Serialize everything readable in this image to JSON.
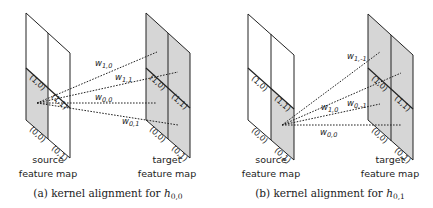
{
  "colors": {
    "stroke": "#222222",
    "shade": "#d6d6d6",
    "background": "#ffffff"
  },
  "panels": [
    {
      "id": "a",
      "caption": "(a) kernel alignment for ",
      "caption_math": "h",
      "caption_sub": "0,0",
      "source": {
        "label_line1": "source",
        "label_line2": "feature map",
        "cells": [
          "(1,0)",
          "(1,1)",
          "(0,0)",
          "(0,1)"
        ],
        "shaded_cells": [
          "(0,0)"
        ]
      },
      "target": {
        "label_line1": "target",
        "label_line2": "feature map",
        "cells": [
          "(1,0)",
          "(1,1)",
          "(0,0)",
          "(0,1)"
        ],
        "shaded_cells": [
          "(1,0)",
          "(1,1)",
          "(0,0)",
          "(0,1)"
        ]
      },
      "weights": [
        {
          "w": "w",
          "sub": "1,0"
        },
        {
          "w": "w",
          "sub": "1,1"
        },
        {
          "w": "w",
          "sub": "0,0"
        },
        {
          "w": "w",
          "sub": "0,1"
        }
      ]
    },
    {
      "id": "b",
      "caption": "(b) kernel alignment for ",
      "caption_math": "h",
      "caption_sub": "0,1",
      "source": {
        "label_line1": "source",
        "label_line2": "feature map",
        "cells": [
          "(1,0)",
          "(1,1)",
          "(0,0)",
          "(0,1)"
        ],
        "shaded_cells": [
          "(0,1)"
        ]
      },
      "target": {
        "label_line1": "target",
        "label_line2": "feature map",
        "cells": [
          "(1,0)",
          "(1,1)",
          "(0,0)",
          "(0,1)"
        ],
        "shaded_cells": [
          "(1,0)",
          "(1,1)",
          "(0,0)",
          "(0,1)"
        ]
      },
      "weights": [
        {
          "w": "w",
          "sub": "1,-1"
        },
        {
          "w": "w",
          "sub": "1,0"
        },
        {
          "w": "w",
          "sub": "0,-1"
        },
        {
          "w": "w",
          "sub": "0,0"
        }
      ]
    }
  ]
}
